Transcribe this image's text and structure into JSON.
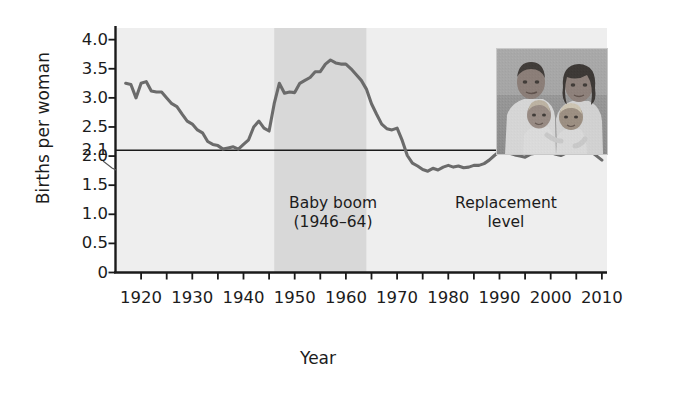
{
  "chart_data": {
    "type": "line",
    "title": "",
    "xlabel": "Year",
    "ylabel": "Births per woman",
    "xlim": [
      1915,
      2011
    ],
    "ylim": [
      0,
      4.2
    ],
    "grid": false,
    "legend": "none",
    "y_ticks": [
      "4.0",
      "3.5",
      "3.0",
      "2.5",
      "2.1",
      "2.0",
      "1.5",
      "1.0",
      "0.5",
      "0"
    ],
    "y_tick_values": [
      4.0,
      3.5,
      3.0,
      2.5,
      2.1,
      2.0,
      1.5,
      1.0,
      0.5,
      0
    ],
    "x_ticks": [
      "1920",
      "1930",
      "1940",
      "1950",
      "1960",
      "1970",
      "1980",
      "1990",
      "2000",
      "2010"
    ],
    "x_tick_values": [
      1920,
      1930,
      1940,
      1950,
      1960,
      1970,
      1980,
      1990,
      2000,
      2010
    ],
    "x_minor_step": 5,
    "series": [
      {
        "name": "Total fertility rate",
        "color": "#6b6b6b",
        "x": [
          1917,
          1918,
          1919,
          1920,
          1921,
          1922,
          1923,
          1924,
          1925,
          1926,
          1927,
          1928,
          1929,
          1930,
          1931,
          1932,
          1933,
          1934,
          1935,
          1936,
          1937,
          1938,
          1939,
          1940,
          1941,
          1942,
          1943,
          1944,
          1945,
          1946,
          1947,
          1948,
          1949,
          1950,
          1951,
          1952,
          1953,
          1954,
          1955,
          1956,
          1957,
          1958,
          1959,
          1960,
          1961,
          1962,
          1963,
          1964,
          1965,
          1966,
          1967,
          1968,
          1969,
          1970,
          1971,
          1972,
          1973,
          1974,
          1975,
          1976,
          1977,
          1978,
          1979,
          1980,
          1981,
          1982,
          1983,
          1984,
          1985,
          1986,
          1987,
          1988,
          1989,
          1990,
          1991,
          1992,
          1993,
          1994,
          1995,
          1996,
          1997,
          1998,
          1999,
          2000,
          2001,
          2002,
          2003,
          2004,
          2005,
          2006,
          2007,
          2008,
          2009,
          2010
        ],
        "values": [
          3.25,
          3.23,
          3.0,
          3.25,
          3.28,
          3.12,
          3.1,
          3.1,
          3.0,
          2.9,
          2.85,
          2.72,
          2.6,
          2.55,
          2.45,
          2.4,
          2.25,
          2.2,
          2.18,
          2.12,
          2.14,
          2.16,
          2.12,
          2.2,
          2.28,
          2.5,
          2.6,
          2.48,
          2.43,
          2.9,
          3.25,
          3.08,
          3.1,
          3.09,
          3.25,
          3.3,
          3.35,
          3.45,
          3.45,
          3.58,
          3.65,
          3.6,
          3.58,
          3.58,
          3.5,
          3.4,
          3.3,
          3.15,
          2.9,
          2.72,
          2.55,
          2.47,
          2.45,
          2.48,
          2.27,
          2.01,
          1.88,
          1.83,
          1.77,
          1.74,
          1.79,
          1.76,
          1.81,
          1.84,
          1.81,
          1.83,
          1.8,
          1.81,
          1.84,
          1.84,
          1.87,
          1.93,
          2.01,
          2.08,
          2.06,
          2.05,
          2.02,
          2.0,
          1.98,
          2.03,
          2.05,
          2.06,
          2.08,
          2.06,
          2.03,
          2.01,
          2.05,
          2.05,
          2.06,
          2.11,
          2.12,
          2.07,
          2.0,
          1.93
        ]
      }
    ],
    "reference_lines": [
      {
        "name": "replacement-level-line",
        "orientation": "horizontal",
        "value": 2.1,
        "label": "Replacement\nlevel",
        "color": "#1a1a1a"
      }
    ],
    "shaded_regions": [
      {
        "name": "baby-boom-band",
        "x_start": 1946,
        "x_end": 1964,
        "label": "Baby boom\n(1946–64)",
        "color": "#d8d8d8"
      }
    ],
    "plot_background_color": "#eeeeee",
    "axis_color": "#1a1a1a"
  },
  "annotations": {
    "baby_boom_line1": "Baby boom",
    "baby_boom_line2": "(1946–64)",
    "replacement_line1": "Replacement",
    "replacement_line2": "level",
    "replacement_callout_value": "2.1"
  },
  "inset_photo": {
    "name": "family-photo",
    "description": "Vintage black-and-white family portrait: father, mother and two young children"
  }
}
